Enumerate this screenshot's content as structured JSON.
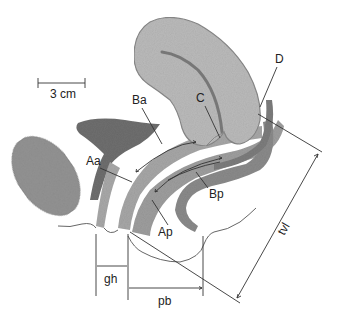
{
  "figure": {
    "type": "anatomical sagittal diagram (POP-Q measurement points)",
    "scale_bar": {
      "label": "3 cm"
    },
    "labels": {
      "Ba": "Ba",
      "Aa": "Aa",
      "Ap": "Ap",
      "Bp": "Bp",
      "C": "C",
      "D": "D",
      "gh": "gh",
      "pb": "pb",
      "tvl": "tvl"
    },
    "colors": {
      "uterus_fill": "#b9b9b9",
      "uterus_outline": "#8a8a8a",
      "bladder_fill": "#6f6f6f",
      "symphysis_fill": "#8f8f8f",
      "vagina_anterior_wall": "#a3a3a3",
      "vagina_posterior_wall": "#9a9a9a",
      "rectum_fill": "#7e7e7e",
      "line_color": "#333333"
    }
  }
}
